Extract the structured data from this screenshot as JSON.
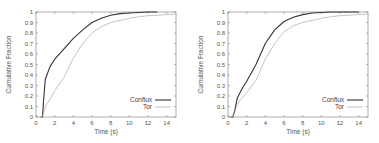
{
  "chart_data": [
    {
      "type": "line",
      "title": "",
      "xlabel": "Time (s)",
      "ylabel": "Cumulative Fraction",
      "xlim": [
        0,
        15
      ],
      "ylim": [
        0,
        1
      ],
      "xticks": [
        0,
        2,
        4,
        6,
        8,
        10,
        12,
        14
      ],
      "yticks": [
        0,
        0.1,
        0.2,
        0.3,
        0.4,
        0.5,
        0.6,
        0.7,
        0.8,
        0.9,
        1
      ],
      "grid": false,
      "legend_position": "lower right",
      "series": [
        {
          "name": "Conflux",
          "color": "#333333",
          "x": [
            0.5,
            0.7,
            0.8,
            1.0,
            1.5,
            2.0,
            3.0,
            4.0,
            5.0,
            6.0,
            7.0,
            8.0,
            9.0,
            10.0,
            11.0,
            12.0,
            13.0
          ],
          "y": [
            0.0,
            0.0,
            0.15,
            0.36,
            0.48,
            0.55,
            0.65,
            0.75,
            0.83,
            0.9,
            0.94,
            0.97,
            0.985,
            0.99,
            0.995,
            1.0,
            1.0
          ]
        },
        {
          "name": "Tor",
          "color": "#aaaaaa",
          "x": [
            0.5,
            0.7,
            1.0,
            1.5,
            2.0,
            3.0,
            4.0,
            5.0,
            6.0,
            7.0,
            8.0,
            9.0,
            10.0,
            11.0,
            12.0,
            13.0,
            14.0,
            15.0
          ],
          "y": [
            0.0,
            0.0,
            0.1,
            0.17,
            0.25,
            0.38,
            0.56,
            0.7,
            0.8,
            0.86,
            0.9,
            0.92,
            0.94,
            0.955,
            0.965,
            0.97,
            0.975,
            0.98
          ]
        }
      ]
    },
    {
      "type": "line",
      "title": "",
      "xlabel": "Time (s)",
      "ylabel": "Cumulative Fraction",
      "xlim": [
        0,
        15
      ],
      "ylim": [
        0,
        1
      ],
      "xticks": [
        0,
        2,
        4,
        6,
        8,
        10,
        12,
        14
      ],
      "yticks": [
        0,
        0.1,
        0.2,
        0.3,
        0.4,
        0.5,
        0.6,
        0.7,
        0.8,
        0.9,
        1
      ],
      "grid": false,
      "legend_position": "lower right",
      "series": [
        {
          "name": "Conflux",
          "color": "#333333",
          "x": [
            0.3,
            0.5,
            0.7,
            1.0,
            1.5,
            2.0,
            3.0,
            4.0,
            5.0,
            6.0,
            7.0,
            8.0,
            9.0,
            10.0,
            11.0,
            12.0,
            13.0,
            14.0
          ],
          "y": [
            0.0,
            0.0,
            0.05,
            0.18,
            0.27,
            0.34,
            0.5,
            0.7,
            0.83,
            0.91,
            0.95,
            0.975,
            0.99,
            0.995,
            1.0,
            1.0,
            1.0,
            1.0
          ]
        },
        {
          "name": "Tor",
          "color": "#aaaaaa",
          "x": [
            0.3,
            0.5,
            0.7,
            1.0,
            1.5,
            2.0,
            3.0,
            4.0,
            5.0,
            6.0,
            7.0,
            8.0,
            9.0,
            10.0,
            11.0,
            12.0,
            13.0,
            14.0,
            15.0
          ],
          "y": [
            0.0,
            0.0,
            0.04,
            0.12,
            0.18,
            0.23,
            0.35,
            0.55,
            0.7,
            0.81,
            0.87,
            0.9,
            0.92,
            0.94,
            0.955,
            0.965,
            0.97,
            0.975,
            0.98
          ]
        }
      ]
    }
  ],
  "charts": [
    {
      "xlabel": "Time (s)",
      "ylabel": "Cumulative Fraction",
      "legend": [
        "Conflux",
        "Tor"
      ],
      "xtick_labels": [
        "0",
        "2",
        "4",
        "6",
        "8",
        "10",
        "12",
        "14"
      ],
      "ytick_labels": [
        "0",
        "0.1",
        "0.2",
        "0.3",
        "0.4",
        "0.5",
        "0.6",
        "0.7",
        "0.8",
        "0.9",
        "1"
      ]
    },
    {
      "xlabel": "Time (s)",
      "ylabel": "Cumulative Fraction",
      "legend": [
        "Conflux",
        "Tor"
      ],
      "xtick_labels": [
        "0",
        "2",
        "4",
        "6",
        "8",
        "10",
        "12",
        "14"
      ],
      "ytick_labels": [
        "0",
        "0.1",
        "0.2",
        "0.3",
        "0.4",
        "0.5",
        "0.6",
        "0.7",
        "0.8",
        "0.9",
        "1"
      ]
    }
  ]
}
